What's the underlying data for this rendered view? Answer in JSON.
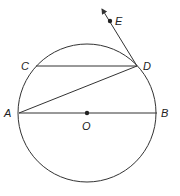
{
  "diagram": {
    "points": {
      "A": {
        "label": "A",
        "x": 19,
        "y": 113
      },
      "B": {
        "label": "B",
        "x": 157,
        "y": 113
      },
      "C": {
        "label": "C",
        "x": 36,
        "y": 66
      },
      "D": {
        "label": "D",
        "x": 137,
        "y": 66
      },
      "E": {
        "label": "E",
        "x": 110,
        "y": 21
      },
      "O": {
        "label": "O",
        "x": 87,
        "y": 113
      }
    },
    "circle": {
      "center": "O",
      "radius": 69
    },
    "segments": [
      "AB",
      "CD",
      "AD"
    ],
    "rays": [
      {
        "from": "D",
        "through": "E"
      }
    ],
    "stroke_color": "#333333"
  }
}
